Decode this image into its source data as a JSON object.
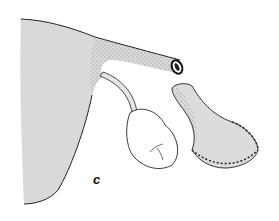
{
  "figure": {
    "panel_label": "c",
    "parts": [
      {
        "name": "uterus",
        "fill": "#d9d9d9"
      },
      {
        "name": "fallopian-tube-cut-end"
      },
      {
        "name": "ovarian-ligament"
      },
      {
        "name": "ovary"
      },
      {
        "name": "fimbriated-tube-segment"
      }
    ],
    "colors": {
      "background": "#ffffff",
      "tissue": "#d9d9d9",
      "outline": "#222222",
      "stipple": "#555555"
    }
  }
}
